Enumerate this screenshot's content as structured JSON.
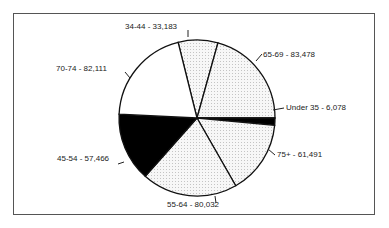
{
  "chart_data": {
    "type": "pie",
    "title": "",
    "total": 403839,
    "start_angle_deg": -104,
    "direction": "clockwise",
    "slices": [
      {
        "label": "34-44 - 33,183",
        "category": "34-44",
        "value": 33183,
        "fill": "#ececec",
        "pattern": "dots"
      },
      {
        "label": "65-69 - 83,478",
        "category": "65-69",
        "value": 83478,
        "fill": "#f0f0f0",
        "pattern": "dots"
      },
      {
        "label": "Under 35 - 6,078",
        "category": "Under 35",
        "value": 6078,
        "fill": "#000000",
        "pattern": "solid"
      },
      {
        "label": "75+ - 61,491",
        "category": "75+",
        "value": 61491,
        "fill": "#eeeeee",
        "pattern": "dots"
      },
      {
        "label": "55-64 - 80,032",
        "category": "55-64",
        "value": 80032,
        "fill": "#eaeaea",
        "pattern": "dots"
      },
      {
        "label": "45-54 - 57,466",
        "category": "45-54",
        "value": 57466,
        "fill": "#000000",
        "pattern": "solid"
      },
      {
        "label": "70-74 - 82,111",
        "category": "70-74",
        "value": 82111,
        "fill": "#ffffff",
        "pattern": "solid"
      }
    ],
    "legend": "none (inline labels with leader lines)"
  },
  "labels": {
    "s0": "34-44 - 33,183",
    "s1": "65-69 - 83,478",
    "s2": "Under 35 - 6,078",
    "s3": "75+ - 61,491",
    "s4": "55-64 - 80,032",
    "s5": "45-54 - 57,466",
    "s6": "70-74 - 82,111"
  }
}
